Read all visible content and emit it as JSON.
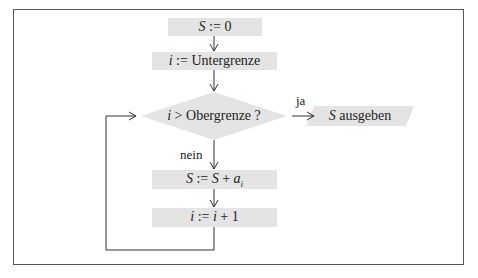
{
  "diagram": {
    "type": "flowchart",
    "colors": {
      "box_fill": "#e4e4e4",
      "line": "#333333",
      "frame": "#555555"
    },
    "nodes": [
      {
        "id": "init_s",
        "shape": "rect",
        "var": "S",
        "op": " := ",
        "rest": "0"
      },
      {
        "id": "init_i",
        "shape": "rect",
        "var": "i",
        "op": " := ",
        "rest": "Untergrenze"
      },
      {
        "id": "cond",
        "shape": "diamond",
        "var": "i",
        "op": " > ",
        "rest": "Obergrenze ?"
      },
      {
        "id": "output",
        "shape": "parallelogram",
        "var": "S",
        "rest": " ausgeben"
      },
      {
        "id": "accumulate",
        "shape": "rect",
        "var": "S",
        "op": " := ",
        "var2": "S",
        "plus": " + ",
        "var3": "a",
        "sub": "i"
      },
      {
        "id": "increment",
        "shape": "rect",
        "var": "i",
        "op": " := ",
        "var2": "i",
        "rest": " + 1"
      }
    ],
    "edge_labels": {
      "yes": "ja",
      "no": "nein"
    }
  }
}
